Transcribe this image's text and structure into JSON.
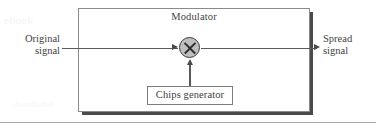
{
  "figure": {
    "type": "block-diagram",
    "background_color": "#ffffff",
    "ink_color": "#3f3f3f",
    "watermark_text": "ebook",
    "watermark_text_2": "downloaded"
  },
  "outer_block": {
    "title": "Modulator",
    "border_color": "#8a8a8a",
    "shadow_color": "#4a4a4a",
    "fill_color": "#ffffff"
  },
  "multiplier": {
    "symbol": "×",
    "icon_name": "multiplier-circle-icon",
    "fill_color": "#bfbfbf",
    "stroke_color": "#3b3b3b"
  },
  "inner_block": {
    "label": "Chips generator",
    "border_color": "#7d7d7d",
    "fill_color": "#ffffff"
  },
  "ports": {
    "input": {
      "line1": "Original",
      "line2": "signal"
    },
    "output": {
      "line1": "Spread",
      "line2": "signal"
    }
  },
  "connectors": {
    "input_arrow_name": "arrow-into-multiplier",
    "output_arrow_name": "arrow-to-spread-signal",
    "chips_arrow_name": "arrow-chips-to-multiplier",
    "line_color": "#5a5a5a"
  }
}
